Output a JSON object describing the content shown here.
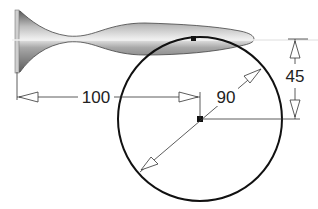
{
  "diagram": {
    "type": "cad-sketch",
    "dimensions": {
      "horizontal": {
        "label": "100"
      },
      "radius": {
        "label": "90"
      },
      "vertical": {
        "label": "45"
      }
    },
    "colors": {
      "line": "#111111",
      "dim_line": "#333333",
      "shape_dark": "#6d6d6d",
      "shape_light": "#e9e9e9",
      "centerline": "#f4f4f4"
    }
  }
}
